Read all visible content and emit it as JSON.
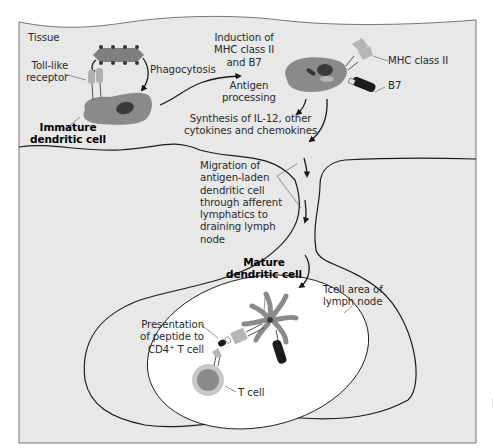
{
  "diagram": {
    "colors": {
      "tissue_bg": "#e8e8e8",
      "tcell_area_bg": "#ffffff",
      "outline": "#1a1a1a",
      "cell_gray": "#8a8a8a",
      "receptor_light": "#b5b5b5",
      "nucleus_dark": "#3a3a3a",
      "b7_black": "#1c1c1c"
    },
    "regions": {
      "tissue": "Tissue",
      "tcell_area": "Tcell area of\nlymph node"
    },
    "labels": {
      "toll_like_receptor": "Toll-like\nreceptor",
      "phagocytosis": "Phagocytosis",
      "immature_dc": "Immature\ndendritic cell",
      "induction": "Induction of\nMHC class II\nand B7",
      "antigen_processing": "Antigen\nprocessing",
      "mhc_class_ii": "MHC class II",
      "b7": "B7",
      "synthesis": "Synthesis of IL-12, other\ncytokines and chemokines",
      "migration": "Migration of\nantigen-laden\ndendritic cell\nthrough afferent\nlymphatics to\ndraining lymph\nnode",
      "mature_dc": "Mature\ndendritic cell",
      "presentation": "Presentation\nof peptide to\nCD4⁺ T cell",
      "t_cell": "T cell"
    },
    "flow": [
      "Immature dendritic cell",
      "Induction of MHC class II and B7 / Antigen processing",
      "Synthesis of IL-12, other cytokines and chemokines",
      "Migration through afferent lymphatics",
      "Mature dendritic cell",
      "Presentation of peptide to CD4+ T cell"
    ]
  }
}
